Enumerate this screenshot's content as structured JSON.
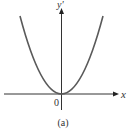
{
  "figure": {
    "caption": "(a)",
    "x_axis_label": "x",
    "y_axis_label": "y'",
    "origin_label": "0",
    "curve": {
      "type": "parabola",
      "description": "upward-opening parabola with vertex at origin",
      "color": "#5a5a5a"
    },
    "axis_color": "#333333"
  }
}
